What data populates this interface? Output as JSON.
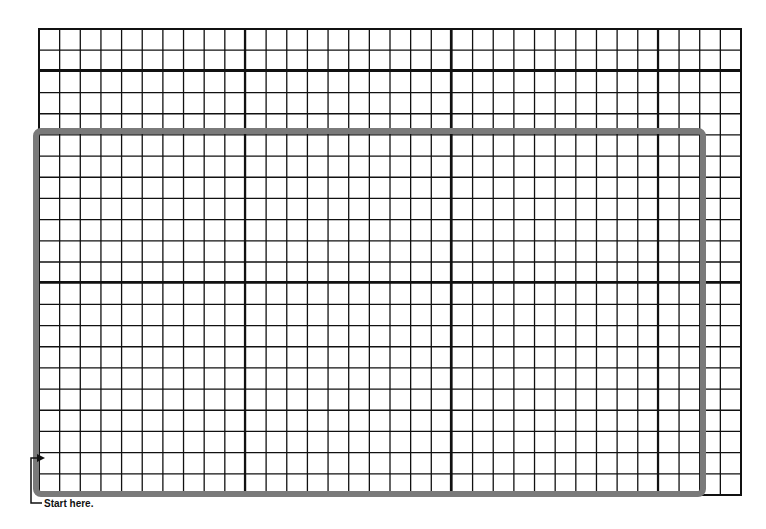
{
  "diagram": {
    "type": "grid-paper",
    "grid": {
      "left": 39,
      "top": 29,
      "right": 741,
      "bottom": 495,
      "columns": 34,
      "rows": 22,
      "major_vertical_x": [
        245,
        451,
        658
      ],
      "major_horizontal_y": [
        70,
        282
      ],
      "line_color": "#111111"
    },
    "outline": {
      "left": 36,
      "top": 131,
      "right": 703,
      "bottom": 494,
      "stroke_width": 6,
      "color": "#7a7a7a",
      "corner_radius": 5
    },
    "start_marker": {
      "label": "Start here.",
      "arrow": "right-arrow"
    }
  }
}
